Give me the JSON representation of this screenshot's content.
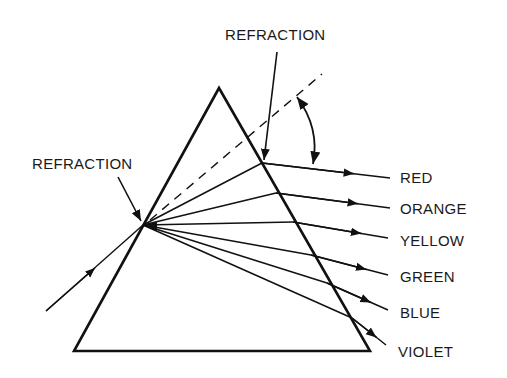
{
  "diagram": {
    "colors": {
      "ink": "#111111",
      "background": "#ffffff"
    },
    "labels": {
      "top_refraction": "REFRACTION",
      "left_refraction": "REFRACTION"
    },
    "prism": {
      "apex": [
        219,
        88
      ],
      "bottom_left": [
        74,
        351
      ],
      "bottom_right": [
        370,
        351
      ]
    },
    "incident_ray": {
      "from": [
        46,
        311
      ],
      "to": [
        143,
        225
      ]
    },
    "entry_point": [
      143,
      225
    ],
    "normal_dashed": {
      "from": [
        150,
        220
      ],
      "to": [
        322,
        74
      ]
    },
    "deviation_angle_arc": {
      "from": [
        297,
        96
      ],
      "to": [
        313,
        165
      ]
    },
    "spectrum": [
      {
        "name": "RED",
        "exit": [
          262,
          163
        ],
        "end": [
          390,
          178
        ],
        "label_pos": [
          400,
          183
        ]
      },
      {
        "name": "ORANGE",
        "exit": [
          276,
          193
        ],
        "end": [
          390,
          208
        ],
        "label_pos": [
          400,
          214
        ]
      },
      {
        "name": "YELLOW",
        "exit": [
          293,
          222
        ],
        "end": [
          388,
          238
        ],
        "label_pos": [
          400,
          246
        ]
      },
      {
        "name": "GREEN",
        "exit": [
          311,
          255
        ],
        "end": [
          388,
          275
        ],
        "label_pos": [
          400,
          282
        ]
      },
      {
        "name": "BLUE",
        "exit": [
          327,
          283
        ],
        "end": [
          388,
          310
        ],
        "label_pos": [
          400,
          318
        ]
      },
      {
        "name": "VIOLET",
        "exit": [
          352,
          318
        ],
        "end": [
          386,
          345
        ],
        "label_pos": [
          398,
          357
        ]
      }
    ]
  }
}
